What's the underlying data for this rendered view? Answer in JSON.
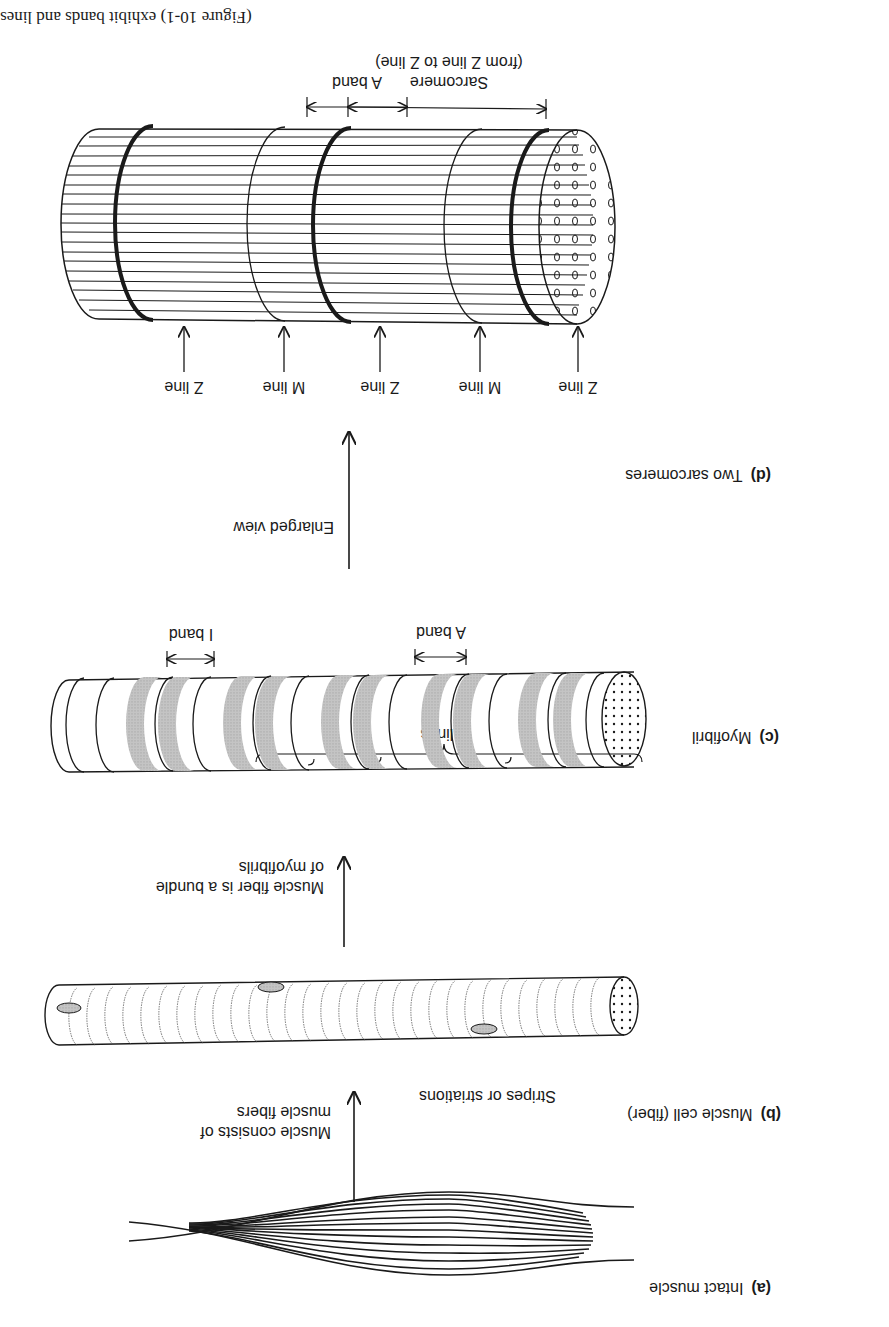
{
  "caption_fragment": "(Figure 10-1) exhibit bands and lines",
  "panels": {
    "a": {
      "letter": "(a)",
      "title": "Intact muscle"
    },
    "b": {
      "letter": "(b)",
      "title": "Muscle cell (fiber)",
      "stripes_label": "Stripes or striations"
    },
    "c": {
      "letter": "(c)",
      "title": "Myofibril",
      "z_lines_label": "Z lines",
      "a_band_label": "A band",
      "i_band_label": "I band"
    },
    "d": {
      "letter": "(d)",
      "title": "Two sarcomeres",
      "line_labels": [
        "Z line",
        "M line",
        "Z line",
        "M line",
        "Z line"
      ],
      "sarcomere_label": "Sarcomere",
      "sarcomere_sub": "(from Z line to Z line)",
      "a_band_label": "A band"
    }
  },
  "transitions": {
    "a_to_b": [
      "Muscle consists of",
      "muscle fibers"
    ],
    "b_to_c": [
      "Muscle fiber is a bundle",
      "of myofibrils"
    ],
    "c_to_d": [
      "Enlarged view"
    ]
  },
  "orientation": "rotated 180 degrees",
  "colors": {
    "ink": "#1a1a1a",
    "band_gray": "#b8b8b8",
    "paper": "#ffffff"
  }
}
